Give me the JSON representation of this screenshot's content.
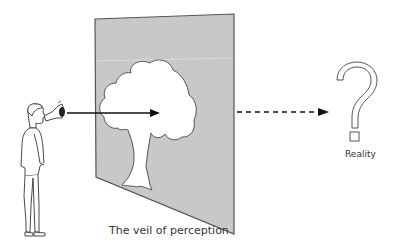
{
  "diagram": {
    "veil_label": "The veil of perception",
    "reality_label": "Reality",
    "reality_symbol": "?",
    "elements": {
      "observer": "standing-man-icon",
      "eye": "eye-icon",
      "veil": "grey-panel",
      "perceived_object": "tree-silhouette",
      "solid_arrow": "observer-to-tree",
      "dashed_arrow": "veil-to-reality"
    },
    "colors": {
      "panel": "#c8c8c8",
      "panel_edge": "#555555",
      "tree": "#ffffff",
      "ink": "#222222",
      "text": "#333333"
    }
  }
}
